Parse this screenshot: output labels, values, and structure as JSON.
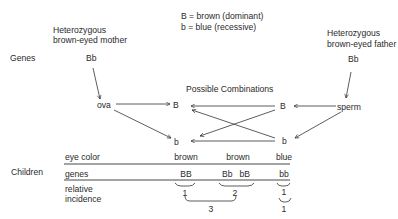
{
  "legend": {
    "dominant": "B = brown (dominant)",
    "recessive": "b = blue (recessive)"
  },
  "parents": {
    "mother": {
      "line1": "Heterozygous",
      "line2": "brown-eyed mother",
      "genes": "Bb",
      "gamete": "ova"
    },
    "father": {
      "line1": "Heterozygous",
      "line2": "brown-eyed father",
      "genes": "Bb",
      "gamete": "sperm"
    }
  },
  "row_labels": {
    "genes": "Genes",
    "children": "Children"
  },
  "combinations": {
    "title": "Possible Combinations",
    "mother_alleles": [
      "B",
      "b"
    ],
    "father_alleles": [
      "B",
      "b"
    ]
  },
  "children_table": {
    "headers": {
      "eye_color": "eye color",
      "genes": "genes",
      "incidence_1": "relative",
      "incidence_2": "incidence"
    },
    "columns": [
      {
        "eye_color": "brown",
        "genes": "BB",
        "incidence": "1"
      },
      {
        "eye_color": "brown",
        "genes": "Bb   bB",
        "incidence": "2"
      },
      {
        "eye_color": "blue",
        "genes": "bb",
        "incidence": "1"
      }
    ],
    "ratio": {
      "brown_total": "3",
      "blue_total": "1"
    }
  }
}
